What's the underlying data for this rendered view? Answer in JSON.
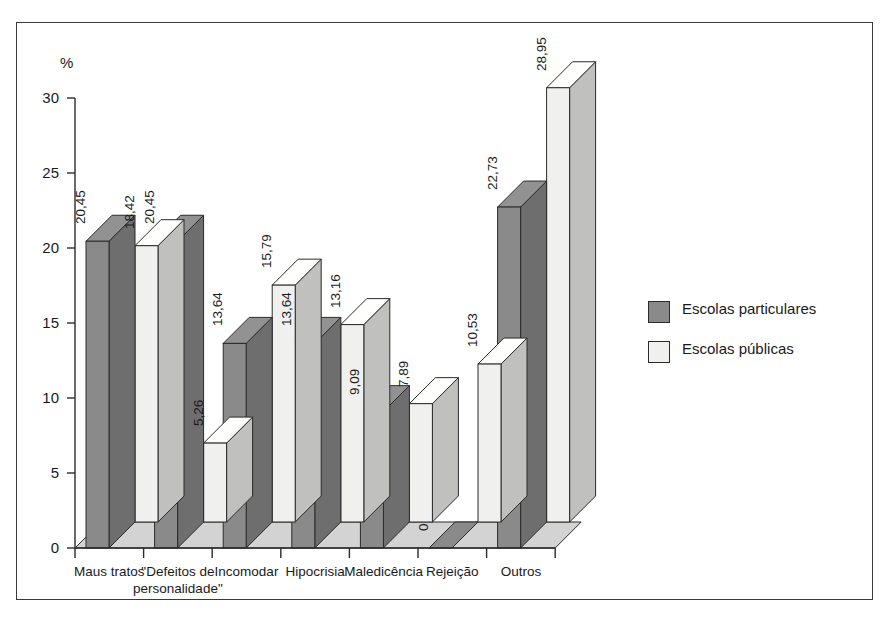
{
  "chart_data": {
    "type": "bar",
    "title": "",
    "subtitle": "",
    "xlabel": "",
    "ylabel": "%",
    "ylim": [
      0,
      30
    ],
    "ytick_step": 5,
    "yticks": [
      "0",
      "5",
      "10",
      "15",
      "20",
      "25",
      "30"
    ],
    "grid": false,
    "legend_position": "right",
    "decimal_separator": ",",
    "style": "3d-clustered-column",
    "categories": [
      "Maus tratos",
      "\"Defeitos de personalidade\"",
      "Incomodar",
      "Hipocrisia",
      "Maledicência",
      "Rejeição",
      "Outros"
    ],
    "category_lines": [
      [
        "Maus tratos"
      ],
      [
        "\"Defeitos de",
        "personalidade\""
      ],
      [
        "Incomodar"
      ],
      [
        "Hipocrisia"
      ],
      [
        "Maledicência"
      ],
      [
        "Rejeição"
      ],
      [
        "Outros"
      ]
    ],
    "series": [
      {
        "name": "Escolas particulares",
        "color": "#8a8a8a",
        "values": [
          20.45,
          20.45,
          13.64,
          13.64,
          9.09,
          0,
          22.73
        ],
        "labels": [
          "20,45",
          "20,45",
          "13,64",
          "13,64",
          "9,09",
          "0",
          "22,73"
        ]
      },
      {
        "name": "Escolas públicas",
        "color": "#f0f0ee",
        "values": [
          18.42,
          5.26,
          15.79,
          13.16,
          7.89,
          10.53,
          28.95
        ],
        "labels": [
          "18,42",
          "5,26",
          "15,79",
          "13,16",
          "7,89",
          "10,53",
          "28,95"
        ]
      }
    ]
  },
  "legend": {
    "items": [
      {
        "label": "Escolas particulares",
        "color": "#8a8a8a"
      },
      {
        "label": "Escolas públicas",
        "color": "#f0f0ee"
      }
    ]
  },
  "colors": {
    "series_dark": "#8a8a8a",
    "series_light": "#f0f0ee",
    "floor": "#d3d3d3",
    "axis": "#2b2b2b",
    "frame": "#3a3a3a",
    "text": "#1a1a1a"
  }
}
